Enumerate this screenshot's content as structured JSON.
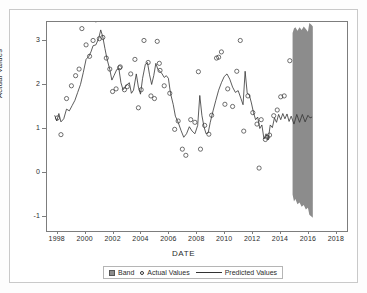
{
  "chart_data": {
    "type": "line",
    "title": "",
    "xlabel": "DATE",
    "ylabel": "Actual Values",
    "xlim": [
      1997.3,
      2018.8
    ],
    "ylim": [
      -1.35,
      3.4
    ],
    "xticks": [
      1998,
      2000,
      2002,
      2004,
      2006,
      2008,
      2010,
      2012,
      2014,
      2016,
      2018
    ],
    "xticklabels": [
      "1998",
      "2000",
      "2002",
      "2004",
      "2006",
      "2008",
      "2010",
      "2012",
      "2014",
      "2016",
      "2018"
    ],
    "yticks": [
      -1,
      0,
      1,
      2,
      3
    ],
    "yticklabels": [
      "-1",
      "0",
      "1",
      "2",
      "3"
    ],
    "grid": false,
    "legend_position": "bottom",
    "legend": [
      {
        "label": "Band",
        "marker": "band-swatch"
      },
      {
        "label": "Actual Values",
        "marker": "open-circle"
      },
      {
        "label": "Predicted Values",
        "marker": "line"
      }
    ],
    "colors": {
      "band": "#8c8c8c",
      "line": "#333333",
      "marker_stroke": "#333333",
      "axis": "#7d7d7d",
      "text": "#2b2b2b",
      "frame": "#c9c9c9",
      "background": "#ffffff"
    },
    "series": [
      {
        "name": "Actual Values",
        "type": "scatter",
        "marker": "open-circle",
        "points": [
          [
            1998.05,
            1.22
          ],
          [
            1998.3,
            0.84
          ],
          [
            1998.7,
            1.66
          ],
          [
            1999.05,
            1.95
          ],
          [
            1999.35,
            2.18
          ],
          [
            1999.6,
            2.33
          ],
          [
            1999.8,
            3.25
          ],
          [
            2000.1,
            2.88
          ],
          [
            2000.35,
            2.62
          ],
          [
            2000.6,
            2.98
          ],
          [
            2000.8,
            3.45
          ],
          [
            2001.05,
            3.02
          ],
          [
            2001.3,
            3.05
          ],
          [
            2001.55,
            2.58
          ],
          [
            2001.8,
            2.33
          ],
          [
            2002.0,
            1.82
          ],
          [
            2002.25,
            1.88
          ],
          [
            2002.5,
            2.36
          ],
          [
            2002.55,
            2.38
          ],
          [
            2002.85,
            1.86
          ],
          [
            2003.05,
            1.93
          ],
          [
            2003.3,
            2.22
          ],
          [
            2003.6,
            2.55
          ],
          [
            2003.85,
            1.45
          ],
          [
            2004.05,
            1.86
          ],
          [
            2004.25,
            2.98
          ],
          [
            2004.55,
            2.48
          ],
          [
            2004.75,
            1.72
          ],
          [
            2005.0,
            1.66
          ],
          [
            2005.2,
            2.96
          ],
          [
            2005.35,
            2.46
          ],
          [
            2005.4,
            2.3
          ],
          [
            2005.7,
            1.95
          ],
          [
            2006.1,
            1.78
          ],
          [
            2006.45,
            0.96
          ],
          [
            2006.7,
            1.15
          ],
          [
            2007.0,
            0.51
          ],
          [
            2007.25,
            0.37
          ],
          [
            2007.6,
            1.18
          ],
          [
            2007.9,
            1.12
          ],
          [
            2008.15,
            2.27
          ],
          [
            2008.3,
            0.51
          ],
          [
            2008.6,
            1.05
          ],
          [
            2008.9,
            0.85
          ],
          [
            2009.1,
            1.28
          ],
          [
            2009.45,
            2.58
          ],
          [
            2009.6,
            2.6
          ],
          [
            2009.8,
            2.72
          ],
          [
            2010.05,
            1.53
          ],
          [
            2010.25,
            1.88
          ],
          [
            2010.6,
            1.48
          ],
          [
            2010.9,
            2.28
          ],
          [
            2011.15,
            2.98
          ],
          [
            2011.4,
            0.92
          ],
          [
            2011.7,
            1.72
          ],
          [
            2012.05,
            1.34
          ],
          [
            2012.35,
            1.08
          ],
          [
            2012.5,
            0.08
          ],
          [
            2012.65,
            1.18
          ],
          [
            2012.95,
            0.73
          ],
          [
            2013.1,
            0.78
          ],
          [
            2013.25,
            0.83
          ],
          [
            2013.55,
            1.27
          ],
          [
            2013.8,
            1.4
          ],
          [
            2014.05,
            1.7
          ],
          [
            2014.3,
            1.72
          ],
          [
            2014.7,
            2.52
          ]
        ]
      },
      {
        "name": "Predicted Values",
        "type": "line",
        "points": [
          [
            1997.85,
            1.28
          ],
          [
            1998.0,
            1.15
          ],
          [
            1998.15,
            1.32
          ],
          [
            1998.3,
            1.13
          ],
          [
            1998.5,
            1.2
          ],
          [
            1998.7,
            1.42
          ],
          [
            1998.9,
            1.38
          ],
          [
            1999.1,
            1.5
          ],
          [
            1999.3,
            1.62
          ],
          [
            1999.5,
            1.8
          ],
          [
            1999.7,
            1.98
          ],
          [
            1999.9,
            2.25
          ],
          [
            2000.1,
            2.55
          ],
          [
            2000.3,
            2.62
          ],
          [
            2000.45,
            2.72
          ],
          [
            2000.6,
            2.86
          ],
          [
            2000.8,
            2.88
          ],
          [
            2001.0,
            3.02
          ],
          [
            2001.15,
            3.22
          ],
          [
            2001.3,
            3.06
          ],
          [
            2001.45,
            2.8
          ],
          [
            2001.6,
            2.56
          ],
          [
            2001.8,
            2.32
          ],
          [
            2001.95,
            2.08
          ],
          [
            2002.1,
            2.18
          ],
          [
            2002.3,
            2.32
          ],
          [
            2002.45,
            2.34
          ],
          [
            2002.6,
            2.02
          ],
          [
            2002.75,
            1.86
          ],
          [
            2002.9,
            1.92
          ],
          [
            2003.05,
            1.98
          ],
          [
            2003.2,
            2.02
          ],
          [
            2003.35,
            1.78
          ],
          [
            2003.5,
            1.85
          ],
          [
            2003.7,
            2.22
          ],
          [
            2003.85,
            1.92
          ],
          [
            2004.0,
            1.76
          ],
          [
            2004.15,
            2.12
          ],
          [
            2004.35,
            2.44
          ],
          [
            2004.5,
            2.48
          ],
          [
            2004.65,
            2.2
          ],
          [
            2004.8,
            1.98
          ],
          [
            2004.95,
            2.18
          ],
          [
            2005.1,
            2.46
          ],
          [
            2005.25,
            2.32
          ],
          [
            2005.4,
            2.28
          ],
          [
            2005.55,
            2.22
          ],
          [
            2005.7,
            2.14
          ],
          [
            2005.85,
            2.18
          ],
          [
            2006.0,
            2.12
          ],
          [
            2006.15,
            1.78
          ],
          [
            2006.35,
            1.52
          ],
          [
            2006.5,
            1.26
          ],
          [
            2006.7,
            1.12
          ],
          [
            2006.9,
            0.94
          ],
          [
            2007.1,
            0.78
          ],
          [
            2007.3,
            0.86
          ],
          [
            2007.5,
            1.02
          ],
          [
            2007.7,
            0.92
          ],
          [
            2007.9,
            0.86
          ],
          [
            2008.1,
            1.05
          ],
          [
            2008.25,
            1.73
          ],
          [
            2008.4,
            1.28
          ],
          [
            2008.55,
            1.02
          ],
          [
            2008.7,
            0.86
          ],
          [
            2008.85,
            0.88
          ],
          [
            2009.0,
            1.12
          ],
          [
            2009.2,
            1.38
          ],
          [
            2009.4,
            1.62
          ],
          [
            2009.6,
            1.85
          ],
          [
            2009.8,
            2.02
          ],
          [
            2010.0,
            2.16
          ],
          [
            2010.2,
            2.22
          ],
          [
            2010.4,
            2.1
          ],
          [
            2010.6,
            1.92
          ],
          [
            2010.8,
            1.8
          ],
          [
            2011.0,
            1.84
          ],
          [
            2011.2,
            1.66
          ],
          [
            2011.35,
            1.52
          ],
          [
            2011.5,
            2.28
          ],
          [
            2011.65,
            1.78
          ],
          [
            2011.8,
            1.74
          ],
          [
            2011.95,
            1.56
          ],
          [
            2012.1,
            1.34
          ],
          [
            2012.25,
            1.18
          ],
          [
            2012.4,
            1.24
          ],
          [
            2012.55,
            0.98
          ],
          [
            2012.7,
            1.06
          ],
          [
            2012.85,
            0.74
          ],
          [
            2013.0,
            0.86
          ],
          [
            2013.15,
            0.72
          ],
          [
            2013.3,
            1.06
          ],
          [
            2013.45,
            1.0
          ],
          [
            2013.6,
            1.22
          ],
          [
            2013.75,
            1.12
          ],
          [
            2013.9,
            1.3
          ],
          [
            2014.05,
            1.18
          ],
          [
            2014.2,
            1.32
          ],
          [
            2014.35,
            1.2
          ],
          [
            2014.5,
            1.31
          ],
          [
            2014.65,
            1.14
          ],
          [
            2014.8,
            1.26
          ],
          [
            2015.0,
            1.08
          ],
          [
            2015.2,
            1.3
          ],
          [
            2015.4,
            1.12
          ],
          [
            2015.6,
            1.3
          ],
          [
            2015.8,
            1.13
          ],
          [
            2016.0,
            1.28
          ],
          [
            2016.15,
            1.22
          ],
          [
            2016.3,
            1.24
          ]
        ]
      }
    ],
    "band": {
      "name": "Band",
      "x_start": 2014.9,
      "x_end": 2016.35,
      "upper": [
        [
          2014.9,
          3.15
        ],
        [
          2015.0,
          3.25
        ],
        [
          2015.1,
          3.28
        ],
        [
          2015.25,
          3.2
        ],
        [
          2015.4,
          3.28
        ],
        [
          2015.55,
          3.22
        ],
        [
          2015.7,
          3.3
        ],
        [
          2015.85,
          3.24
        ],
        [
          2016.0,
          3.18
        ],
        [
          2016.1,
          3.38
        ],
        [
          2016.25,
          3.34
        ],
        [
          2016.35,
          3.3
        ]
      ],
      "lower": [
        [
          2014.9,
          -0.52
        ],
        [
          2015.0,
          -0.68
        ],
        [
          2015.1,
          -0.62
        ],
        [
          2015.25,
          -0.74
        ],
        [
          2015.4,
          -0.7
        ],
        [
          2015.55,
          -0.8
        ],
        [
          2015.7,
          -0.76
        ],
        [
          2015.85,
          -0.86
        ],
        [
          2016.0,
          -0.82
        ],
        [
          2016.1,
          -0.98
        ],
        [
          2016.25,
          -1.02
        ],
        [
          2016.35,
          -1.05
        ]
      ]
    }
  }
}
